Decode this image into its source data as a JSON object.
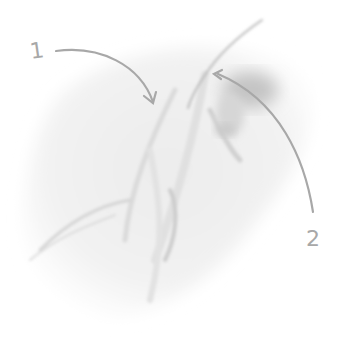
{
  "illustration": {
    "subject": "pencil-sketch-feather-tuft",
    "stroke_color": "#a8a8a8",
    "shade_color": "#c8c8c8",
    "background": "#ffffff"
  },
  "callouts": [
    {
      "label": "1"
    },
    {
      "label": "2"
    }
  ]
}
